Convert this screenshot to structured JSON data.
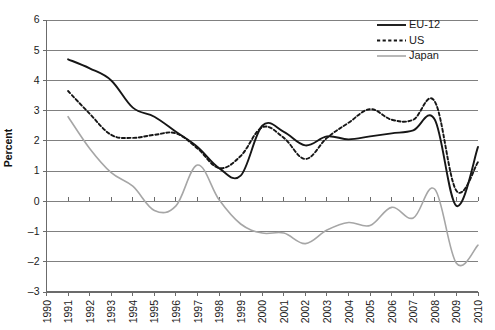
{
  "chart_data": {
    "type": "line",
    "title": "",
    "xlabel": "",
    "ylabel": "Percent",
    "grid": true,
    "legend_position": "top-right",
    "xlim": [
      1990,
      2010
    ],
    "ylim": [
      -3,
      6
    ],
    "y_ticks": [
      6,
      5,
      4,
      3,
      2,
      1,
      0,
      -1,
      -2,
      -3
    ],
    "y_tick_labels": [
      "6",
      "5",
      "4",
      "3",
      "2",
      "1",
      "0",
      "–1",
      "–2",
      "–3"
    ],
    "x": [
      1990,
      1991,
      1992,
      1993,
      1994,
      1995,
      1996,
      1997,
      1998,
      1999,
      2000,
      2001,
      2002,
      2003,
      2004,
      2005,
      2006,
      2007,
      2008,
      2009,
      2010
    ],
    "x_tick_labels": [
      "1990",
      "1991",
      "1992",
      "1993",
      "1994",
      "1995",
      "1996",
      "1997",
      "1998",
      "1999",
      "2000",
      "2001",
      "2002",
      "2003",
      "2004",
      "2005",
      "2006",
      "2007",
      "2008",
      "2009",
      "2010"
    ],
    "series": [
      {
        "name": "EU-12",
        "style": "solid",
        "color": "#161616",
        "x": [
          1991,
          1992,
          1993,
          1994,
          1995,
          1996,
          1997,
          1998,
          1999,
          2000,
          2001,
          2002,
          2003,
          2004,
          2005,
          2006,
          2007,
          2008,
          2009,
          2010
        ],
        "values": [
          4.7,
          4.4,
          4.0,
          3.1,
          2.8,
          2.3,
          1.8,
          1.1,
          0.85,
          2.5,
          2.3,
          1.85,
          2.15,
          2.05,
          2.15,
          2.25,
          2.35,
          2.7,
          -0.15,
          1.8
        ]
      },
      {
        "name": "US",
        "style": "dotted",
        "color": "#161616",
        "x": [
          1991,
          1992,
          1993,
          1994,
          1995,
          1996,
          1997,
          1998,
          1999,
          2000,
          2001,
          2002,
          2003,
          2004,
          2005,
          2006,
          2007,
          2008,
          2009,
          2010
        ],
        "values": [
          3.65,
          2.9,
          2.2,
          2.1,
          2.2,
          2.25,
          1.75,
          1.1,
          1.5,
          2.45,
          2.1,
          1.4,
          2.1,
          2.6,
          3.05,
          2.7,
          2.7,
          3.3,
          0.35,
          1.3
        ]
      },
      {
        "name": "Japan",
        "style": "solid",
        "color": "#a6a6a6",
        "x": [
          1991,
          1992,
          1993,
          1994,
          1995,
          1996,
          1997,
          1998,
          1999,
          2000,
          2001,
          2002,
          2003,
          2004,
          2005,
          2006,
          2007,
          2008,
          2009,
          2010
        ],
        "values": [
          2.8,
          1.75,
          0.95,
          0.5,
          -0.3,
          -0.15,
          1.2,
          0.05,
          -0.75,
          -1.05,
          -1.05,
          -1.4,
          -0.95,
          -0.7,
          -0.8,
          -0.2,
          -0.55,
          0.4,
          -2.05,
          -1.45
        ]
      }
    ]
  },
  "legend": {
    "items": [
      {
        "label": "EU-12",
        "swatch": "solid-black-line"
      },
      {
        "label": "US",
        "swatch": "dotted-black-line"
      },
      {
        "label": "Japan",
        "swatch": "solid-gray-line"
      }
    ]
  },
  "colors": {
    "eu_line": "#161616",
    "us_line": "#161616",
    "japan_line": "#a6a6a6",
    "gridline": "#808080",
    "axis": "#6b6b6b",
    "text": "#1a1a1a",
    "background": "#ffffff"
  }
}
